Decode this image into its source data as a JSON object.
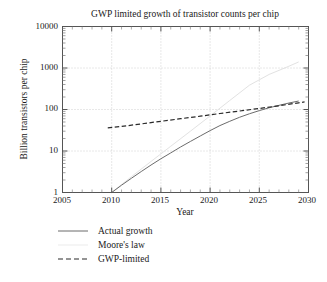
{
  "chart_data": {
    "type": "line",
    "title": "GWP limited growth of transistor counts per chip",
    "xlabel": "Year",
    "ylabel": "Billion transistors per chip",
    "xlim": [
      2005,
      2030
    ],
    "ylim": [
      1,
      10000
    ],
    "yscale": "log",
    "grid": true,
    "legend_position": "below-axes-left",
    "xticks": [
      "2005",
      "2010",
      "2015",
      "2020",
      "2025",
      "2030"
    ],
    "xtick_values": [
      2005,
      2010,
      2015,
      2020,
      2025,
      2030
    ],
    "yticks": [
      "1",
      "10",
      "100",
      "1000",
      "10000"
    ],
    "ytick_values": [
      1,
      10,
      100,
      1000,
      10000
    ],
    "series": [
      {
        "name": "Actual growth",
        "style": "solid",
        "color": "#6b6b6b",
        "x": [
          2010,
          2011,
          2012,
          2013,
          2014,
          2015,
          2016,
          2017,
          2018,
          2019,
          2020,
          2021,
          2022,
          2023,
          2024,
          2025,
          2026,
          2027,
          2028,
          2029
        ],
        "y": [
          1.0,
          1.5,
          2.2,
          3.2,
          4.6,
          6.5,
          9.0,
          12.5,
          17.0,
          23.0,
          31.0,
          41.0,
          52.0,
          65.0,
          79.0,
          94.0,
          110.0,
          126.0,
          143.0,
          160.0
        ]
      },
      {
        "name": "Moore's law",
        "style": "solid",
        "color": "#e2e2e2",
        "x": [
          2010,
          2012,
          2014,
          2016,
          2018,
          2020,
          2022,
          2024,
          2026,
          2028,
          2029
        ],
        "y": [
          1.0,
          2.4,
          5.6,
          13.0,
          30.0,
          70.0,
          165.0,
          385.0,
          700.0,
          1100.0,
          1400.0
        ]
      },
      {
        "name": "GWP-limited",
        "style": "dashed",
        "color": "#2a2a2a",
        "x": [
          2009.6,
          2011,
          2013,
          2015,
          2017,
          2019,
          2021,
          2023,
          2025,
          2027,
          2029,
          2029.6
        ],
        "y": [
          36.0,
          39.0,
          45.0,
          52.0,
          60.0,
          69.0,
          80.0,
          92.0,
          106.0,
          123.0,
          145.0,
          152.0
        ]
      }
    ]
  },
  "legend": {
    "items": [
      {
        "label": "Actual growth",
        "key": "solid-line-key"
      },
      {
        "label": "Moore's law",
        "key": "faint-line-key"
      },
      {
        "label": "GWP-limited",
        "key": "dashed-line-key"
      }
    ]
  }
}
